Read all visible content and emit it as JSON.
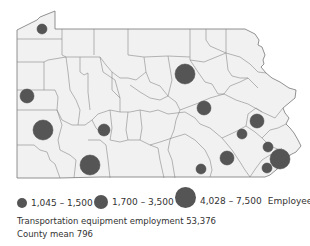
{
  "map": {
    "title": "Pennsylvania county map",
    "background_color": "#f1f1f1",
    "border_color": "#777777",
    "symbol_color": "#555555",
    "symbols": [
      {
        "id": "nw-erie",
        "cx": 42,
        "cy": 29,
        "r": 5,
        "class": "small"
      },
      {
        "id": "north-central",
        "cx": 185,
        "cy": 74,
        "r": 10,
        "class": "large"
      },
      {
        "id": "west-mercer",
        "cx": 27,
        "cy": 96,
        "r": 7,
        "class": "medium"
      },
      {
        "id": "southwest-beaver",
        "cx": 43,
        "cy": 130,
        "r": 10,
        "class": "large"
      },
      {
        "id": "central-blair",
        "cx": 104,
        "cy": 130,
        "r": 6,
        "class": "medium"
      },
      {
        "id": "south-somerset",
        "cx": 90,
        "cy": 165,
        "r": 10,
        "class": "large"
      },
      {
        "id": "central-union",
        "cx": 204,
        "cy": 108,
        "r": 7,
        "class": "medium"
      },
      {
        "id": "east-lehigh",
        "cx": 257,
        "cy": 121,
        "r": 7,
        "class": "medium"
      },
      {
        "id": "berks",
        "cx": 242,
        "cy": 134,
        "r": 5,
        "class": "small"
      },
      {
        "id": "montgomery",
        "cx": 268,
        "cy": 147,
        "r": 5,
        "class": "small"
      },
      {
        "id": "lancaster",
        "cx": 227,
        "cy": 158,
        "r": 7,
        "class": "medium"
      },
      {
        "id": "york",
        "cx": 201,
        "cy": 169,
        "r": 5,
        "class": "small"
      },
      {
        "id": "philadelphia",
        "cx": 280,
        "cy": 159,
        "r": 10,
        "class": "large"
      },
      {
        "id": "delaware",
        "cx": 267,
        "cy": 168,
        "r": 5,
        "class": "small"
      }
    ]
  },
  "legend": {
    "items": [
      {
        "label": "1,045 – 1,500",
        "size": "small"
      },
      {
        "label": "1,700 – 3,500",
        "size": "medium"
      },
      {
        "label": "4,028 – 7,500",
        "size": "large"
      }
    ],
    "unit": "Employees",
    "total_line": "Transportation equipment employment 53,376",
    "mean_line": "County mean 796"
  }
}
